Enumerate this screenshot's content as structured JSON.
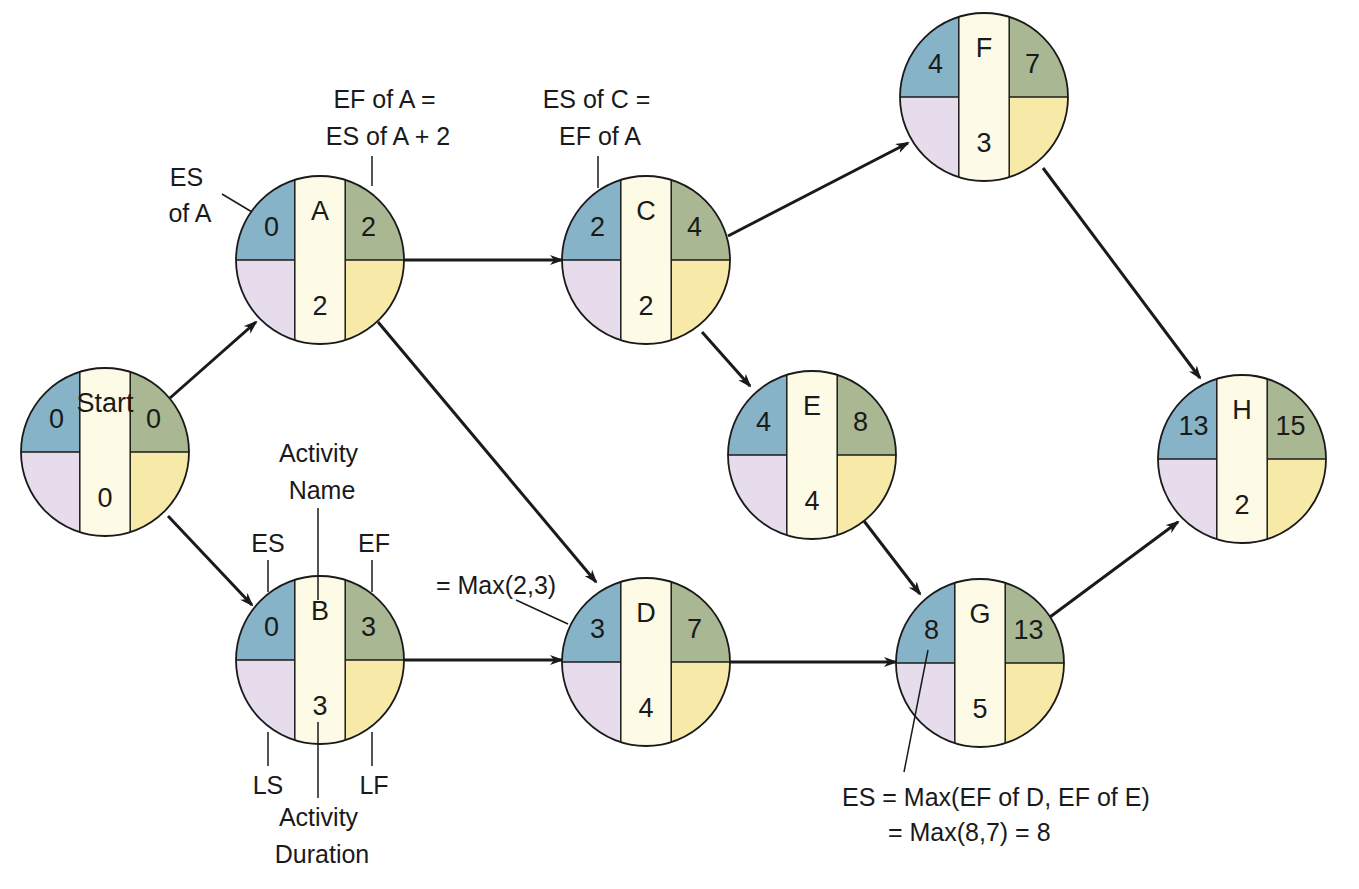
{
  "colors": {
    "es": "#86b3c7",
    "ef": "#a9b793",
    "ls": "#e6dcec",
    "lf": "#f7eaa8",
    "center": "#fdfbe6",
    "stroke": "#1a1a1a"
  },
  "nodes": [
    {
      "id": "start",
      "name": "Start",
      "es": "0",
      "ef": "0",
      "duration": "0",
      "cx": 105,
      "cy": 452,
      "r": 84
    },
    {
      "id": "a",
      "name": "A",
      "es": "0",
      "ef": "2",
      "duration": "2",
      "cx": 320,
      "cy": 260,
      "r": 84
    },
    {
      "id": "b",
      "name": "B",
      "es": "0",
      "ef": "3",
      "duration": "3",
      "cx": 320,
      "cy": 660,
      "r": 84
    },
    {
      "id": "c",
      "name": "C",
      "es": "2",
      "ef": "4",
      "duration": "2",
      "cx": 646,
      "cy": 260,
      "r": 84
    },
    {
      "id": "d",
      "name": "D",
      "es": "3",
      "ef": "7",
      "duration": "4",
      "cx": 646,
      "cy": 662,
      "r": 84
    },
    {
      "id": "e",
      "name": "E",
      "es": "4",
      "ef": "8",
      "duration": "4",
      "cx": 812,
      "cy": 455,
      "r": 84
    },
    {
      "id": "f",
      "name": "F",
      "es": "4",
      "ef": "7",
      "duration": "3",
      "cx": 984,
      "cy": 97,
      "r": 84
    },
    {
      "id": "g",
      "name": "G",
      "es": "8",
      "ef": "13",
      "duration": "5",
      "cx": 980,
      "cy": 663,
      "r": 84
    },
    {
      "id": "h",
      "name": "H",
      "es": "13",
      "ef": "15",
      "duration": "2",
      "cx": 1242,
      "cy": 459,
      "r": 84
    }
  ],
  "edges": [
    {
      "from": "start",
      "to": "a",
      "x1": 170,
      "y1": 398,
      "x2": 256,
      "y2": 322
    },
    {
      "from": "start",
      "to": "b",
      "x1": 168,
      "y1": 516,
      "x2": 252,
      "y2": 605
    },
    {
      "from": "a",
      "to": "c",
      "x1": 404,
      "y1": 260,
      "x2": 562,
      "y2": 260
    },
    {
      "from": "a",
      "to": "d",
      "x1": 378,
      "y1": 322,
      "x2": 596,
      "y2": 582
    },
    {
      "from": "b",
      "to": "d",
      "x1": 404,
      "y1": 660,
      "x2": 562,
      "y2": 660
    },
    {
      "from": "c",
      "to": "f",
      "x1": 728,
      "y1": 236,
      "x2": 908,
      "y2": 143
    },
    {
      "from": "c",
      "to": "e",
      "x1": 702,
      "y1": 332,
      "x2": 750,
      "y2": 386
    },
    {
      "from": "d",
      "to": "g",
      "x1": 730,
      "y1": 662,
      "x2": 896,
      "y2": 662
    },
    {
      "from": "e",
      "to": "g",
      "x1": 864,
      "y1": 521,
      "x2": 920,
      "y2": 594
    },
    {
      "from": "f",
      "to": "h",
      "x1": 1043,
      "y1": 168,
      "x2": 1200,
      "y2": 378
    },
    {
      "from": "g",
      "to": "h",
      "x1": 1050,
      "y1": 617,
      "x2": 1178,
      "y2": 522
    }
  ],
  "annotations": {
    "es_of_a": {
      "lines": [
        "ES",
        "of A"
      ]
    },
    "ef_of_a": {
      "lines": [
        "EF of A =",
        "ES of A + 2"
      ]
    },
    "es_of_c": {
      "lines": [
        "ES of C =",
        "EF of A"
      ]
    },
    "activity_name": {
      "lines": [
        "Activity",
        "Name"
      ]
    },
    "es_label": "ES",
    "ef_label": "EF",
    "ls_label": "LS",
    "lf_label": "LF",
    "activity_duration": {
      "lines": [
        "Activity",
        "Duration"
      ]
    },
    "max_d": "= Max(2,3)",
    "es_g": {
      "lines": [
        "ES = Max(EF of D, EF of E)",
        "= Max(8,7) = 8"
      ]
    }
  }
}
